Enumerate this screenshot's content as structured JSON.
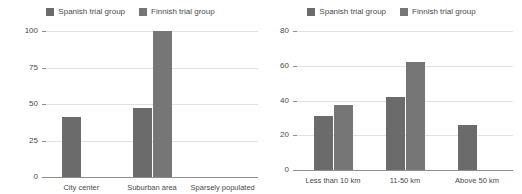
{
  "chart_data": [
    {
      "id": "left",
      "type": "bar",
      "title": "",
      "xlabel": "",
      "ylabel": "",
      "categories": [
        "City center",
        "Suburban area",
        "Sparsely populated"
      ],
      "series": [
        {
          "name": "Spanish trial group",
          "color": "#6b6b6b",
          "values": [
            41,
            47,
            0
          ]
        },
        {
          "name": "Finnish trial group",
          "color": "#767676",
          "values": [
            0,
            100,
            0
          ]
        }
      ],
      "ylim": [
        0,
        100
      ],
      "yticks": [
        0,
        25,
        50,
        75,
        100
      ],
      "ytick_labels": [
        "0",
        "25",
        "50",
        "75",
        "100"
      ],
      "grid": true,
      "legend_position": "top-center"
    },
    {
      "id": "right",
      "type": "bar",
      "title": "",
      "xlabel": "",
      "ylabel": "",
      "categories": [
        "Less than 10 km",
        "11-50 km",
        "Above 50 km"
      ],
      "series": [
        {
          "name": "Spanish trial group",
          "color": "#6b6b6b",
          "values": [
            31,
            42,
            26
          ]
        },
        {
          "name": "Finnish trial group",
          "color": "#767676",
          "values": [
            37.5,
            62,
            0
          ]
        }
      ],
      "ylim": [
        0,
        80
      ],
      "yticks": [
        0,
        20,
        40,
        60,
        80
      ],
      "ytick_labels": [
        "0",
        "20",
        "40",
        "60",
        "80"
      ],
      "grid": true,
      "legend_position": "top-center"
    }
  ]
}
